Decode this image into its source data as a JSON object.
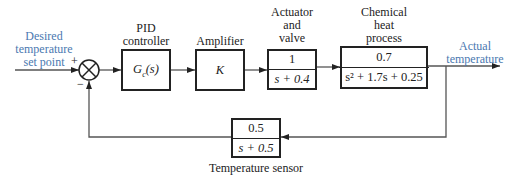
{
  "input": {
    "label_line1": "Desired",
    "label_line2": "temperature",
    "label_line3": "set point"
  },
  "junction": {
    "plus": "+",
    "minus": "−"
  },
  "blocks": [
    {
      "id": "pid",
      "title_line1": "PID",
      "title_line2": "controller",
      "tf": "G_c(s)",
      "tf_main": "G",
      "tf_sub": "c",
      "tf_arg": "(s)"
    },
    {
      "id": "amplifier",
      "title_line1": "Amplifier",
      "tf": "K"
    },
    {
      "id": "actuator",
      "title_line1": "Actuator",
      "title_line2": "and",
      "title_line3": "valve",
      "numerator": "1",
      "denominator": "s + 0.4"
    },
    {
      "id": "process",
      "title_line1": "Chemical",
      "title_line2": "heat",
      "title_line3": "process",
      "numerator": "0.7",
      "denominator": "s² + 1.7s + 0.25"
    },
    {
      "id": "sensor",
      "title_line1": "Temperature sensor",
      "numerator": "0.5",
      "denominator": "s + 0.5"
    }
  ],
  "output": {
    "label_line1": "Actual",
    "label_line2": "temperature"
  },
  "colors": {
    "signal_label": "#4a78b0",
    "line": "#222222"
  }
}
